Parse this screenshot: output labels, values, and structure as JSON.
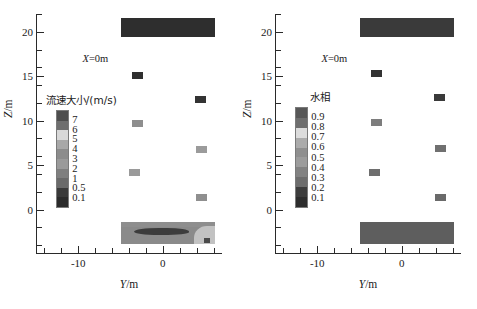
{
  "figure": {
    "background": "#ffffff",
    "panel_count": 2
  },
  "chart_data": [
    {
      "type": "heatmap",
      "panel": "left",
      "title": "",
      "annotation": "X=0m",
      "xlabel": "Y/m",
      "ylabel": "Z/m",
      "xlim": [
        -15,
        7
      ],
      "ylim": [
        -5,
        22
      ],
      "xticks": [
        -10,
        0
      ],
      "xtick_labels": [
        "-10",
        "0"
      ],
      "xticks_minor": [
        -14,
        -12,
        -8,
        -6,
        -4,
        -2,
        2,
        4,
        6
      ],
      "yticks": [
        0,
        5,
        10,
        15,
        20
      ],
      "ytick_labels": [
        "0",
        "5",
        "10",
        "15",
        "20"
      ],
      "yticks_minor": [
        -4,
        -2,
        2,
        4,
        6,
        8,
        12,
        14,
        16,
        18,
        22
      ],
      "grid": false,
      "colorbar": {
        "title": "流速大小/(m/s)",
        "tick_labels": [
          "7",
          "6",
          "5",
          "4",
          "3",
          "2",
          "1",
          "0.5",
          "0.1"
        ],
        "values": [
          7,
          6,
          5,
          4,
          3,
          2,
          1,
          0.5,
          0.1
        ],
        "colors": [
          "#4e4e4e",
          "#6f6f6f",
          "#d8d8d8",
          "#a8a8a8",
          "#8c8c8c",
          "#9a9a9a",
          "#7f7f7f",
          "#6a6a6a",
          "#3a3a3a",
          "#2b2b2b"
        ]
      },
      "regions": [
        {
          "name": "top-slab",
          "y_range": [
            -5.0,
            6.2
          ],
          "z_range": [
            19.4,
            21.5
          ],
          "color": "#2e2e2e"
        },
        {
          "name": "bottom-slab",
          "y_range": [
            -5.0,
            6.2
          ],
          "z_range": [
            -3.9,
            -1.4
          ],
          "color": "#8a8a8a"
        }
      ],
      "markers": [
        {
          "y": -3.0,
          "z": 15.1,
          "color": "#2f2f2f",
          "value": 0.1
        },
        {
          "y": 4.4,
          "z": 12.4,
          "color": "#333333",
          "value": 0.1
        },
        {
          "y": -3.0,
          "z": 9.7,
          "color": "#8e8e8e",
          "value": 2
        },
        {
          "y": 4.6,
          "z": 6.8,
          "color": "#9b9b9b",
          "value": 2
        },
        {
          "y": -3.3,
          "z": 4.2,
          "color": "#9a9a9a",
          "value": 2
        },
        {
          "y": 4.6,
          "z": 1.4,
          "color": "#8f8f8f",
          "value": 2
        }
      ]
    },
    {
      "type": "heatmap",
      "panel": "right",
      "title": "",
      "annotation": "X=0m",
      "xlabel": "Y/m",
      "ylabel": "Z/m",
      "xlim": [
        -15,
        7
      ],
      "ylim": [
        -5,
        22
      ],
      "xticks": [
        -10,
        0
      ],
      "xtick_labels": [
        "-10",
        "0"
      ],
      "xticks_minor": [
        -14,
        -12,
        -8,
        -6,
        -4,
        -2,
        2,
        4,
        6
      ],
      "yticks": [
        0,
        5,
        10,
        15,
        20
      ],
      "ytick_labels": [
        "0",
        "5",
        "10",
        "15",
        "20"
      ],
      "yticks_minor": [
        -4,
        -2,
        2,
        4,
        6,
        8,
        12,
        14,
        16,
        18,
        22
      ],
      "grid": false,
      "colorbar": {
        "title": "水相",
        "tick_labels": [
          "0.9",
          "0.8",
          "0.7",
          "0.6",
          "0.5",
          "0.4",
          "0.3",
          "0.2",
          "0.1"
        ],
        "values": [
          0.9,
          0.8,
          0.7,
          0.6,
          0.5,
          0.4,
          0.3,
          0.2,
          0.1
        ],
        "colors": [
          "#575757",
          "#6e6e6e",
          "#dcdcdc",
          "#ababab",
          "#8f8f8f",
          "#9c9c9c",
          "#828282",
          "#6d6d6d",
          "#3d3d3d",
          "#2d2d2d"
        ]
      },
      "regions": [
        {
          "name": "top-slab",
          "y_range": [
            -5.0,
            6.2
          ],
          "z_range": [
            19.4,
            21.5
          ],
          "color": "#3a3a3a"
        },
        {
          "name": "bottom-slab",
          "y_range": [
            -5.0,
            6.2
          ],
          "z_range": [
            -3.9,
            -1.4
          ],
          "color": "#5e5e5e"
        }
      ],
      "markers": [
        {
          "y": -3.0,
          "z": 15.3,
          "color": "#333333",
          "value": 0.1
        },
        {
          "y": 4.5,
          "z": 12.6,
          "color": "#3a3a3a",
          "value": 0.1
        },
        {
          "y": -3.0,
          "z": 9.8,
          "color": "#7d7d7d",
          "value": 0.4
        },
        {
          "y": 4.6,
          "z": 6.9,
          "color": "#707070",
          "value": 0.4
        },
        {
          "y": -3.2,
          "z": 4.2,
          "color": "#6e6e6e",
          "value": 0.4
        },
        {
          "y": 4.6,
          "z": 1.4,
          "color": "#6a6a6a",
          "value": 0.4
        }
      ]
    }
  ]
}
